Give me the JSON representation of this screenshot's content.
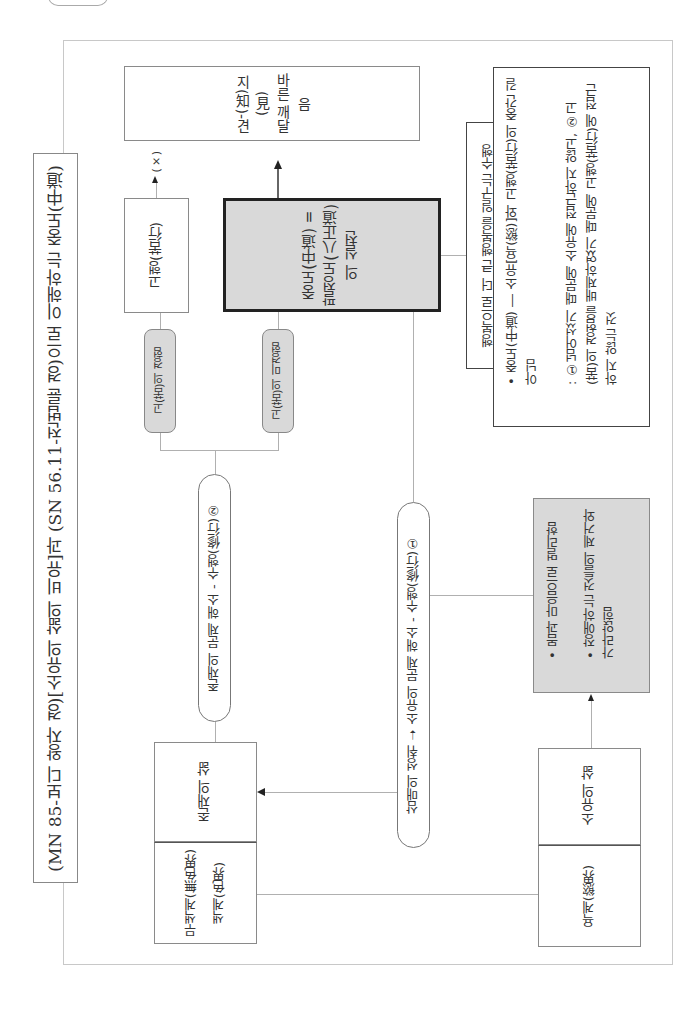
{
  "corner_tab": {
    "label": ""
  },
  "title": "(MN 85-보디 왕자 경)[소유의 삶의 비유]과 (SN 56.11-전법륜 경)으로 이해하는 중도(中道)",
  "nodes": {
    "insight": "지(知)-견(見)\n바른 깨달음",
    "asceticism": "고행(苦行)",
    "asceticism_result": "(×)",
    "middle_way": "중도(中道) =\n팔정도(八正道)\n의 실천",
    "suffering_experienced": "고(苦)의 경험",
    "suffering_unexperienced": "고(苦)의 미경험",
    "practice_2": "존재의 문제 해소 - 수행(修行)②",
    "practice_1": "삼매의 성취 ➝ 소유의 문제 해소 - 수행(修行)①",
    "happiness_label": "행복으로 더 큰 행복을 일구는 수행",
    "middle_way_note": "• 중도(中道) ― 소유[욕(慾)]와 고행(苦行)의 중간 길\n아님\n\n: ①넘어섰기 때문에 소유에 접근하지 않고, ②고\n(苦)의 경험을 배제하였기 때문에 고행(苦行)에 접근\n하지 않는 것",
    "separation_note": "• 몸과 마음으로 멀리함\n\n• 장애하는 것들의 제거와\n가라앉힘",
    "life_of_existence": "존재의 삶",
    "formless_form_realm": "무색계(無色界)\n색계(色界)",
    "life_of_possession": "소유의 삶",
    "desire_realm": "욕계(慾界)"
  },
  "colors": {
    "shaded_box": "#d9d9d9",
    "emphasis_border": "#222222",
    "line": "#b0b0b0",
    "box_border": "#8a8a8a"
  }
}
